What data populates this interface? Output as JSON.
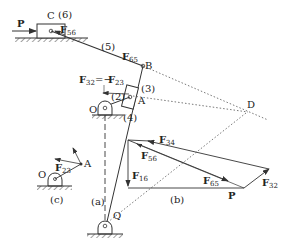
{
  "figure": {
    "mechanism": {
      "labels": {
        "P": "P",
        "C": "C",
        "link6": "(6)",
        "F56": "F",
        "F56_sub": "56",
        "link5": "(5)",
        "F65": "F",
        "F65_sub": "65",
        "B": "B",
        "F32_eq": "F",
        "F32_eq_sub": "32",
        "eq_sign": "=−",
        "F23_eq": "F",
        "F23_eq_sub": "23",
        "link3": "(3)",
        "link2": "(2)",
        "A": "A",
        "O": "O",
        "link4": "(4)",
        "D": "D",
        "Q": "Q",
        "caption": "(a)"
      }
    },
    "force_polygon": {
      "labels": {
        "F34": "F",
        "F34_sub": "34",
        "F56": "F",
        "F56_sub": "56",
        "F16": "F",
        "F16_sub": "16",
        "F65": "F",
        "F65_sub": "65",
        "P": "P",
        "F32": "F",
        "F32_sub": "32",
        "caption": "(b)"
      }
    },
    "crank_detail": {
      "labels": {
        "O": "O",
        "A": "A",
        "F23": "F",
        "F23_sub": "23",
        "caption": "(c)"
      }
    }
  }
}
